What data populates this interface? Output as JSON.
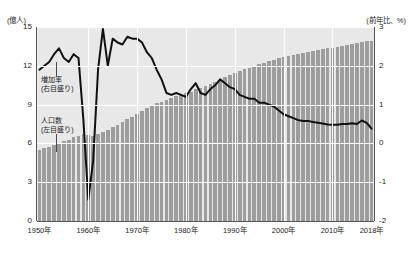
{
  "header": {
    "cropped_text": ""
  },
  "axes": {
    "left_unit": "(億人)",
    "right_unit": "(前年比、%)",
    "left_ticks": [
      "15",
      "12",
      "9",
      "6",
      "3",
      "0"
    ],
    "right_ticks": [
      "3",
      "2",
      "1",
      "0",
      "-1",
      "-2"
    ],
    "x_ticks": [
      "1950年",
      "1960年",
      "1970年",
      "1980年",
      "1990年",
      "2000年",
      "2010年",
      "2018年"
    ]
  },
  "annotations": {
    "growth": {
      "line1": "増加率",
      "line2": "(右目盛り)"
    },
    "population": {
      "line1": "人口数",
      "line2": "(左目盛り)"
    }
  },
  "colors": {
    "plot_background": "#e8e8e8",
    "bar_fill": "#9d9d9d",
    "line_stroke": "#111111",
    "gridline": "#ffffff",
    "axis": "#555555"
  },
  "chart_data": {
    "type": "bar",
    "title": "",
    "subtitle": "",
    "xlabel": "",
    "ylabel": "(億人)",
    "y2label": "(前年比、%)",
    "ylim": [
      0,
      15
    ],
    "y2lim": [
      -2,
      3
    ],
    "xlim": [
      1950,
      2018
    ],
    "grid": true,
    "legend_position": "in-plot annotations",
    "x": [
      1950,
      1951,
      1952,
      1953,
      1954,
      1955,
      1956,
      1957,
      1958,
      1959,
      1960,
      1961,
      1962,
      1963,
      1964,
      1965,
      1966,
      1967,
      1968,
      1969,
      1970,
      1971,
      1972,
      1973,
      1974,
      1975,
      1976,
      1977,
      1978,
      1979,
      1980,
      1981,
      1982,
      1983,
      1984,
      1985,
      1986,
      1987,
      1988,
      1989,
      1990,
      1991,
      1992,
      1993,
      1994,
      1995,
      1996,
      1997,
      1998,
      1999,
      2000,
      2001,
      2002,
      2003,
      2004,
      2005,
      2006,
      2007,
      2008,
      2009,
      2010,
      2011,
      2012,
      2013,
      2014,
      2015,
      2016,
      2017,
      2018
    ],
    "series": [
      {
        "name": "人口数 (左目盛り)",
        "type": "bar",
        "axis": "left",
        "unit": "億人",
        "values": [
          5.52,
          5.63,
          5.75,
          5.88,
          6.02,
          6.15,
          6.28,
          6.46,
          6.6,
          6.72,
          6.62,
          6.59,
          6.73,
          6.92,
          7.05,
          7.25,
          7.45,
          7.64,
          7.85,
          8.07,
          8.3,
          8.52,
          8.72,
          8.92,
          9.09,
          9.24,
          9.37,
          9.49,
          9.63,
          9.75,
          9.87,
          10.01,
          10.17,
          10.3,
          10.44,
          10.59,
          10.75,
          10.93,
          11.1,
          11.27,
          11.43,
          11.58,
          11.72,
          11.85,
          11.99,
          12.11,
          12.24,
          12.36,
          12.48,
          12.58,
          12.67,
          12.76,
          12.85,
          12.92,
          13.0,
          13.08,
          13.14,
          13.21,
          13.28,
          13.35,
          13.41,
          13.47,
          13.54,
          13.61,
          13.68,
          13.75,
          13.83,
          13.9,
          13.95
        ]
      },
      {
        "name": "増加率 (右目盛り)",
        "type": "line",
        "axis": "right",
        "unit": "%",
        "values": [
          1.9,
          2.0,
          2.1,
          2.3,
          2.45,
          2.2,
          2.1,
          2.3,
          2.2,
          0.6,
          -1.45,
          -0.45,
          1.9,
          2.95,
          2.0,
          2.7,
          2.6,
          2.55,
          2.75,
          2.7,
          2.7,
          2.6,
          2.35,
          2.2,
          1.9,
          1.65,
          1.3,
          1.25,
          1.3,
          1.25,
          1.2,
          1.4,
          1.55,
          1.3,
          1.25,
          1.4,
          1.5,
          1.65,
          1.55,
          1.45,
          1.4,
          1.25,
          1.2,
          1.15,
          1.15,
          1.05,
          1.05,
          1.0,
          0.95,
          0.85,
          0.75,
          0.7,
          0.65,
          0.6,
          0.58,
          0.58,
          0.55,
          0.53,
          0.51,
          0.49,
          0.48,
          0.48,
          0.5,
          0.5,
          0.52,
          0.5,
          0.59,
          0.53,
          0.38
        ]
      }
    ]
  }
}
